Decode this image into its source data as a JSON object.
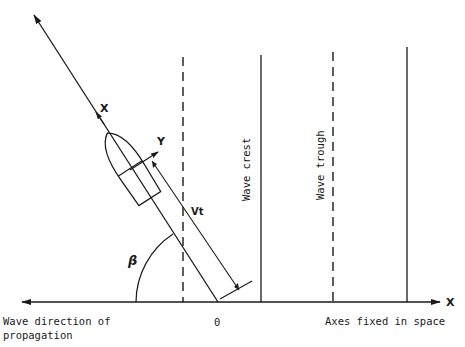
{
  "diagram": {
    "labels": {
      "ship_x_axis": "X",
      "ship_y_axis": "Y",
      "distance": "Vt",
      "heading_angle": "β",
      "wave_crest": "Wave crest",
      "wave_trough": "Wave trough",
      "origin": "0",
      "space_x_axis": "X",
      "wave_direction_line1": "Wave direction of",
      "wave_direction_line2": "propagation",
      "axes_fixed": "Axes fixed in space"
    },
    "elements": {
      "horizontal_axis": "double-headed arrow (left = wave propagation direction, right = X)",
      "wave_lines": [
        {
          "type": "dashed",
          "meaning": "wave trough"
        },
        {
          "type": "solid",
          "meaning": "wave crest"
        },
        {
          "type": "dashed",
          "meaning": "wave trough"
        },
        {
          "type": "solid",
          "meaning": "wave crest"
        }
      ],
      "ship": "hull outline with ship-fixed X (forward) and Y (lateral) axes",
      "dimension": "Vt measured along heading from origin",
      "angle": "β between heading and wave propagation direction"
    }
  }
}
